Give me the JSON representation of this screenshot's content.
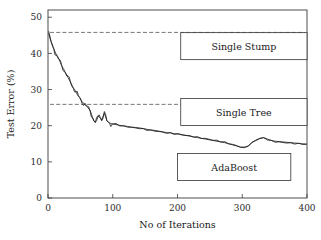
{
  "chart_data": {
    "type": "line",
    "title": "",
    "xlabel": "No of Iterations",
    "ylabel": "Test Error (%)",
    "xlim": [
      0,
      400
    ],
    "ylim": [
      0,
      52
    ],
    "xticks": [
      0,
      100,
      200,
      300,
      400
    ],
    "yticks": [
      0,
      10,
      20,
      30,
      40,
      50
    ],
    "xtick_labels": [
      "0",
      "100",
      "200",
      "300",
      "400"
    ],
    "ytick_labels": [
      "0",
      "10",
      "20",
      "30",
      "40",
      "50"
    ],
    "grid": false,
    "legend_position": "inside-boxes",
    "series": [
      {
        "name": "AdaBoost",
        "style": "solid",
        "color": "#1a1a1a",
        "x": [
          1,
          3,
          5,
          7,
          9,
          11,
          13,
          15,
          17,
          19,
          21,
          23,
          25,
          27,
          29,
          31,
          33,
          35,
          37,
          39,
          41,
          43,
          45,
          47,
          49,
          51,
          53,
          55,
          57,
          59,
          61,
          63,
          65,
          67,
          69,
          71,
          73,
          75,
          77,
          79,
          81,
          83,
          85,
          87,
          89,
          91,
          93,
          95,
          97,
          99,
          105,
          111,
          117,
          123,
          129,
          135,
          141,
          147,
          153,
          159,
          165,
          171,
          177,
          183,
          189,
          195,
          201,
          207,
          213,
          219,
          225,
          231,
          237,
          243,
          249,
          255,
          261,
          267,
          273,
          279,
          285,
          291,
          297,
          303,
          309,
          315,
          321,
          327,
          333,
          339,
          345,
          351,
          357,
          363,
          369,
          375,
          381,
          387,
          393,
          399
        ],
        "y": [
          45.5,
          44.2,
          43.1,
          42.0,
          41.3,
          40.4,
          39.6,
          38.8,
          38.3,
          37.5,
          36.6,
          36.0,
          35.4,
          34.6,
          34.0,
          33.3,
          32.6,
          32.0,
          31.2,
          30.5,
          30.0,
          29.4,
          28.7,
          28.1,
          27.8,
          27.0,
          26.6,
          26.2,
          25.8,
          25.4,
          25.2,
          24.6,
          24.3,
          23.2,
          22.2,
          21.3,
          20.9,
          21.4,
          22.4,
          23.0,
          22.2,
          21.6,
          22.6,
          23.4,
          22.4,
          21.4,
          21.0,
          20.8,
          20.6,
          20.5,
          20.3,
          20.1,
          19.9,
          19.8,
          19.6,
          19.5,
          19.4,
          19.2,
          19.0,
          18.8,
          18.7,
          18.5,
          18.3,
          18.1,
          18.0,
          17.8,
          17.7,
          17.5,
          17.3,
          17.1,
          16.9,
          16.7,
          16.5,
          16.3,
          16.1,
          15.9,
          15.7,
          15.5,
          15.3,
          15.0,
          14.7,
          14.4,
          14.1,
          13.9,
          14.4,
          15.3,
          16.0,
          16.5,
          16.7,
          16.3,
          15.9,
          15.7,
          15.6,
          15.5,
          15.4,
          15.3,
          15.2,
          15.1,
          15.0,
          14.9
        ]
      },
      {
        "name": "Single Stump",
        "style": "dashed",
        "color": "#555555",
        "value": 45.8
      },
      {
        "name": "Single Tree",
        "style": "dashed",
        "color": "#555555",
        "value": 25.9
      }
    ],
    "annotations": [
      {
        "label": "Single Stump",
        "x_range": [
          205,
          400
        ],
        "y_center": 42.0
      },
      {
        "label": "Single Tree",
        "x_range": [
          205,
          400
        ],
        "y_center": 23.8
      },
      {
        "label": "AdaBoost",
        "x_range": [
          200,
          375
        ],
        "y_center": 8.6
      }
    ]
  },
  "axis": {
    "xlabel": "No of Iterations",
    "ylabel": "Test Error (%)"
  },
  "legend": {
    "stump": "Single Stump",
    "tree": "Single Tree",
    "adaboost": "AdaBoost"
  }
}
